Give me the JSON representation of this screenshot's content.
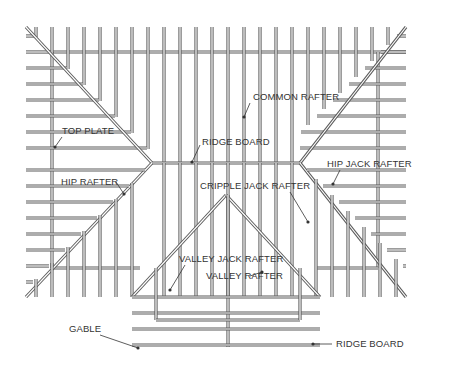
{
  "diagram": {
    "type": "roof-framing-plan",
    "labels": {
      "common_rafter": "COMMON RAFTER",
      "top_plate": "TOP PLATE",
      "ridge_board": "RIDGE BOARD",
      "hip_jack_rafter": "HIP JACK RAFTER",
      "hip_rafter": "HIP RAFTER",
      "cripple_jack_rafter": "CRIPPLE JACK RAFTER",
      "valley_jack_rafter": "VALLEY JACK RAFTER",
      "valley_rafter": "VALLEY RAFTER",
      "gable": "GABLE",
      "ridge_board_gable": "RIDGE BOARD"
    },
    "colors": {
      "line": "#5a5a5a",
      "text": "#333333",
      "background": "#ffffff"
    }
  }
}
